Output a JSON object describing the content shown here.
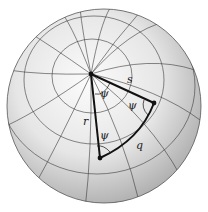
{
  "figure": {
    "labels": {
      "s": "s",
      "r": "r",
      "q": "q",
      "psi_top": "ψ",
      "psi_right": "ψ",
      "psi_bottom": "ψ"
    },
    "colors": {
      "sphere_light": "#f4f4f4",
      "sphere_dark": "#a8a8a8",
      "grid": "#3a3a3a",
      "triangle": "#111111"
    }
  }
}
